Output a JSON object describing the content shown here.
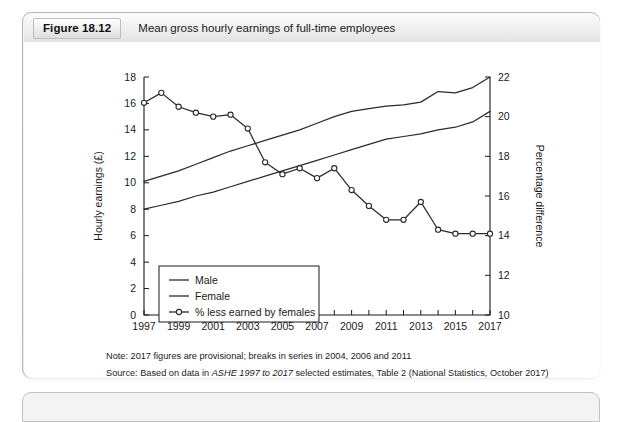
{
  "figure": {
    "number": "Figure 18.12",
    "title": "Mean gross hourly earnings of full-time employees"
  },
  "notes": {
    "note_prefix": "Note: ",
    "note_text": "2017 figures are provisional; breaks in series in 2004, 2006 and 2011",
    "source_prefix": "Source: ",
    "source_pre": "Based on data in ",
    "source_italic": "ASHE 1997 to 2017",
    "source_post": " selected estimates, Table 2 (National Statistics, October 2017)"
  },
  "colors": {
    "line": "#2b2b2b",
    "axis": "#1a1a1a",
    "marker_fill": "#ffffff",
    "panel_bg": "#f0f0f0",
    "card_bg": "#ffffff"
  },
  "chart_data": {
    "type": "line",
    "title": "Mean gross hourly earnings of full-time employees",
    "xlabel": "",
    "ylabel": "Hourly earnings (£)",
    "y2label": "Percentage difference",
    "x": [
      1997,
      1998,
      1999,
      2000,
      2001,
      2002,
      2003,
      2004,
      2005,
      2006,
      2007,
      2008,
      2009,
      2010,
      2011,
      2012,
      2013,
      2014,
      2015,
      2016,
      2017
    ],
    "tick_labels": [
      "1997",
      "1999",
      "2001",
      "2003",
      "2005",
      "2007",
      "2009",
      "2011",
      "2013",
      "2015",
      "2017"
    ],
    "ylim": [
      0,
      18
    ],
    "yticks": [
      0,
      2,
      4,
      6,
      8,
      10,
      12,
      14,
      16,
      18
    ],
    "y2lim": [
      10,
      22
    ],
    "y2ticks": [
      10,
      12,
      14,
      16,
      18,
      20,
      22
    ],
    "grid": false,
    "legend_position": "lower-left",
    "series": [
      {
        "name": "Male",
        "axis": "left",
        "marker": "none",
        "values": [
          10.1,
          10.5,
          10.9,
          11.4,
          11.9,
          12.4,
          12.8,
          13.2,
          13.6,
          14.0,
          14.5,
          15.0,
          15.4,
          15.6,
          15.8,
          15.9,
          16.1,
          16.9,
          16.8,
          17.2,
          18.0
        ]
      },
      {
        "name": "Female",
        "axis": "left",
        "marker": "none",
        "values": [
          8.0,
          8.3,
          8.6,
          9.0,
          9.3,
          9.7,
          10.1,
          10.5,
          10.9,
          11.3,
          11.7,
          12.1,
          12.5,
          12.9,
          13.3,
          13.5,
          13.7,
          14.0,
          14.2,
          14.6,
          15.4
        ]
      },
      {
        "name": "% less earned by females",
        "axis": "right",
        "marker": "circle",
        "values": [
          20.7,
          21.2,
          20.5,
          20.2,
          20.0,
          20.1,
          19.4,
          17.7,
          17.1,
          17.4,
          16.9,
          17.4,
          16.3,
          15.5,
          14.8,
          14.8,
          15.7,
          14.3,
          14.1,
          14.1,
          14.1
        ]
      }
    ]
  }
}
